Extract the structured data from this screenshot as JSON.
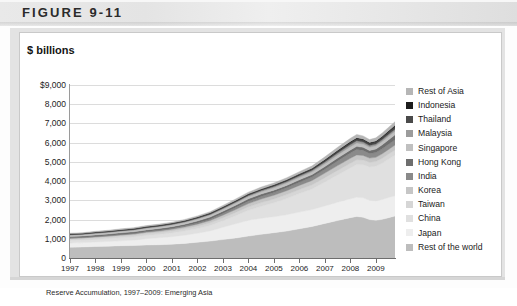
{
  "figure": {
    "banner_label": "FIGURE 9-11"
  },
  "chart_panel": {
    "axis_title": "$ billions"
  },
  "caption": {
    "text": "Reserve Accumulation, 1997–2009: Emerging Asia"
  },
  "chart_data": {
    "type": "area",
    "title": "",
    "subtitle": "",
    "xlabel": "",
    "ylabel": "$ billions",
    "ylim": [
      0,
      9000
    ],
    "xlim": [
      1997,
      2009.75
    ],
    "grid": true,
    "stacked": true,
    "legend_position": "right",
    "ytick_labels": [
      "$9,000",
      "8,000",
      "7,000",
      "6,000",
      "5,000",
      "4,000",
      "3,000",
      "2,000",
      "1,000",
      "0"
    ],
    "ytick_values": [
      9000,
      8000,
      7000,
      6000,
      5000,
      4000,
      3000,
      2000,
      1000,
      0
    ],
    "xtick_labels": [
      "1997",
      "1998",
      "1999",
      "2000",
      "2001",
      "2002",
      "2003",
      "2004",
      "2005",
      "2006",
      "2007",
      "2008",
      "2009"
    ],
    "xtick_values": [
      1997,
      1998,
      1999,
      2000,
      2001,
      2002,
      2003,
      2004,
      2005,
      2006,
      2007,
      2008,
      2009
    ],
    "x": [
      1997,
      1997.5,
      1998,
      1998.5,
      1999,
      1999.5,
      2000,
      2000.5,
      2001,
      2001.5,
      2002,
      2002.5,
      2003,
      2003.5,
      2004,
      2004.5,
      2005,
      2005.5,
      2006,
      2006.5,
      2007,
      2007.5,
      2008,
      2008.25,
      2008.5,
      2008.75,
      2009,
      2009.25,
      2009.5,
      2009.75
    ],
    "series": [
      {
        "name": "Rest of the world",
        "color": "#bdbdbd",
        "values": [
          560,
          575,
          600,
          615,
          640,
          650,
          675,
          690,
          720,
          760,
          820,
          880,
          960,
          1040,
          1140,
          1230,
          1320,
          1400,
          1520,
          1640,
          1800,
          1950,
          2100,
          2160,
          2120,
          2000,
          1960,
          2010,
          2100,
          2180
        ]
      },
      {
        "name": "Japan",
        "color": "#eeeeee",
        "values": [
          220,
          225,
          230,
          240,
          255,
          280,
          330,
          360,
          390,
          430,
          470,
          530,
          640,
          740,
          820,
          840,
          830,
          850,
          870,
          880,
          910,
          950,
          980,
          1000,
          1010,
          1000,
          1010,
          1030,
          1050,
          1060
        ]
      },
      {
        "name": "China",
        "color": "#e0e0e0",
        "values": [
          130,
          135,
          142,
          148,
          155,
          160,
          166,
          175,
          190,
          210,
          240,
          280,
          340,
          420,
          520,
          620,
          720,
          840,
          960,
          1070,
          1240,
          1420,
          1600,
          1700,
          1720,
          1740,
          1800,
          1900,
          2000,
          2120
        ]
      },
      {
        "name": "Taiwan",
        "color": "#d6d6d6",
        "values": [
          80,
          82,
          85,
          88,
          92,
          96,
          100,
          104,
          110,
          118,
          128,
          140,
          155,
          170,
          185,
          196,
          202,
          208,
          214,
          220,
          230,
          238,
          246,
          250,
          248,
          244,
          248,
          252,
          256,
          260
        ]
      },
      {
        "name": "Korea",
        "color": "#c6c6c6",
        "values": [
          34,
          30,
          40,
          48,
          56,
          62,
          70,
          76,
          82,
          92,
          104,
          118,
          134,
          152,
          168,
          182,
          194,
          204,
          214,
          224,
          238,
          250,
          260,
          254,
          236,
          212,
          218,
          230,
          244,
          256
        ]
      },
      {
        "name": "India",
        "color": "#8a8a8a",
        "values": [
          25,
          26,
          27,
          29,
          31,
          33,
          36,
          40,
          45,
          52,
          62,
          74,
          90,
          106,
          122,
          132,
          140,
          150,
          162,
          176,
          198,
          244,
          278,
          286,
          264,
          242,
          248,
          256,
          266,
          278
        ]
      },
      {
        "name": "Hong Kong",
        "color": "#6e6e6e",
        "values": [
          70,
          72,
          75,
          77,
          80,
          82,
          86,
          90,
          94,
          98,
          104,
          110,
          114,
          118,
          122,
          124,
          124,
          126,
          128,
          132,
          140,
          148,
          156,
          160,
          158,
          156,
          182,
          210,
          232,
          252
        ]
      },
      {
        "name": "Singapore",
        "color": "#c0c0c0",
        "values": [
          72,
          74,
          76,
          78,
          80,
          82,
          84,
          86,
          88,
          92,
          96,
          100,
          106,
          112,
          118,
          122,
          124,
          128,
          134,
          140,
          150,
          162,
          172,
          176,
          172,
          168,
          172,
          178,
          184,
          190
        ]
      },
      {
        "name": "Malaysia",
        "color": "#9c9c9c",
        "values": [
          22,
          22,
          24,
          26,
          28,
          30,
          32,
          33,
          34,
          36,
          38,
          42,
          46,
          52,
          58,
          64,
          70,
          74,
          80,
          86,
          94,
          102,
          110,
          112,
          106,
          96,
          92,
          96,
          100,
          104
        ]
      },
      {
        "name": "Thailand",
        "color": "#4a4a4a",
        "values": [
          26,
          25,
          28,
          30,
          32,
          34,
          34,
          34,
          34,
          36,
          38,
          40,
          44,
          48,
          50,
          50,
          52,
          54,
          58,
          64,
          72,
          86,
          100,
          106,
          104,
          102,
          108,
          118,
          128,
          136
        ]
      },
      {
        "name": "Indonesia",
        "color": "#1c1c1c",
        "values": [
          18,
          16,
          22,
          24,
          26,
          27,
          28,
          28,
          28,
          30,
          32,
          34,
          36,
          36,
          36,
          34,
          34,
          36,
          40,
          42,
          56,
          58,
          58,
          56,
          52,
          50,
          54,
          58,
          62,
          66
        ]
      },
      {
        "name": "Rest of Asia",
        "color": "#b6b6b6",
        "values": [
          36,
          36,
          38,
          40,
          42,
          44,
          46,
          48,
          50,
          54,
          58,
          64,
          72,
          80,
          88,
          94,
          98,
          104,
          112,
          120,
          134,
          150,
          164,
          168,
          160,
          152,
          158,
          168,
          178,
          188
        ]
      }
    ],
    "legend_entries": [
      {
        "label": "Rest of Asia",
        "color": "#b6b6b6"
      },
      {
        "label": "Indonesia",
        "color": "#1c1c1c"
      },
      {
        "label": "Thailand",
        "color": "#4a4a4a"
      },
      {
        "label": "Malaysia",
        "color": "#9c9c9c"
      },
      {
        "label": "Singapore",
        "color": "#c0c0c0"
      },
      {
        "label": "Hong Kong",
        "color": "#6e6e6e"
      },
      {
        "label": "India",
        "color": "#8a8a8a"
      },
      {
        "label": "Korea",
        "color": "#c6c6c6"
      },
      {
        "label": "Taiwan",
        "color": "#d6d6d6"
      },
      {
        "label": "China",
        "color": "#e0e0e0"
      },
      {
        "label": "Japan",
        "color": "#eeeeee"
      },
      {
        "label": "Rest of the world",
        "color": "#bdbdbd"
      }
    ]
  }
}
